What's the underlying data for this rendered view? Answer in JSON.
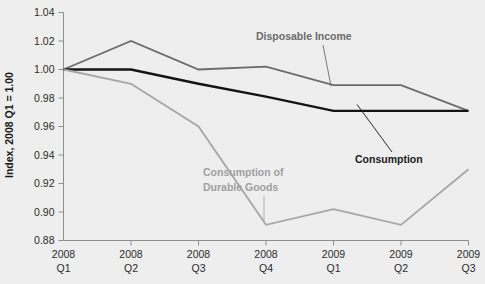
{
  "chart_data": {
    "type": "line",
    "title": "",
    "xlabel": "",
    "ylabel": "Index, 2008 Q1 = 1.00",
    "ylim": [
      0.88,
      1.04
    ],
    "ytick_step": 0.02,
    "grid": false,
    "legend_position": "inline-annotations",
    "categories": [
      "2008 Q1",
      "2008 Q2",
      "2008 Q3",
      "2008 Q4",
      "2009 Q1",
      "2009 Q2",
      "2009 Q3"
    ],
    "x_tick_lines": [
      {
        "year": "2008",
        "quarter": "Q1"
      },
      {
        "year": "2008",
        "quarter": "Q2"
      },
      {
        "year": "2008",
        "quarter": "Q3"
      },
      {
        "year": "2008",
        "quarter": "Q4"
      },
      {
        "year": "2009",
        "quarter": "Q1"
      },
      {
        "year": "2009",
        "quarter": "Q2"
      },
      {
        "year": "2009",
        "quarter": "Q3"
      }
    ],
    "ytick_labels": [
      "0.88",
      "0.90",
      "0.92",
      "0.94",
      "0.96",
      "0.98",
      "1.00",
      "1.02",
      "1.04"
    ],
    "ytick_values": [
      0.88,
      0.9,
      0.92,
      0.94,
      0.96,
      0.98,
      1.0,
      1.02,
      1.04
    ],
    "series": [
      {
        "name": "Disposable Income",
        "color": "#6b6b6b",
        "width": 1.8,
        "values": [
          1.0,
          1.02,
          1.0,
          1.002,
          0.989,
          0.989,
          0.971
        ]
      },
      {
        "name": "Consumption",
        "color": "#141414",
        "width": 2.4,
        "values": [
          1.0,
          1.0,
          0.99,
          0.981,
          0.971,
          0.971,
          0.971
        ]
      },
      {
        "name": "Consumption of Durable Goods",
        "color": "#a6a6a6",
        "width": 1.8,
        "values": [
          1.0,
          0.99,
          0.96,
          0.891,
          0.902,
          0.891,
          0.93
        ]
      }
    ],
    "annotations": [
      {
        "id": "disposable-income",
        "text_lines": [
          "Disposable Income"
        ],
        "style": "mid"
      },
      {
        "id": "consumption",
        "text_lines": [
          "Consumption"
        ],
        "style": "dark"
      },
      {
        "id": "durable-goods",
        "text_lines": [
          "Consumption of",
          "Durable Goods"
        ],
        "style": "light"
      }
    ],
    "colors": {
      "background": "#eeeeee",
      "axis": "#8e8e8e",
      "tick_text": "#2b2b2b",
      "disposable_income": "#6b6b6b",
      "consumption": "#141414",
      "durable_goods": "#a6a6a6"
    }
  }
}
